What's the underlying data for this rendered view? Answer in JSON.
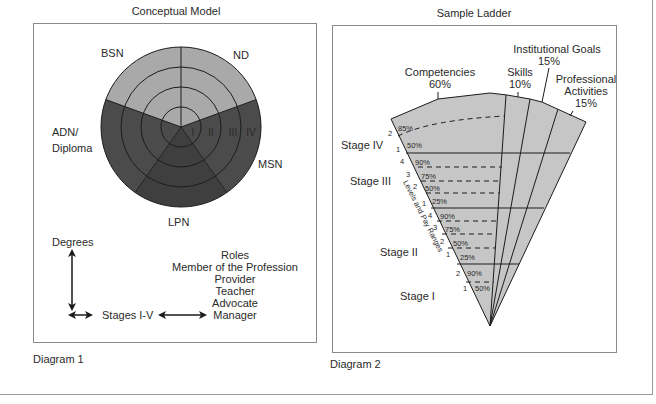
{
  "diagram1": {
    "title": "Conceptual Model",
    "caption": "Diagram 1",
    "segments": [
      {
        "label": "BSN",
        "color": "#a9a9a9"
      },
      {
        "label": "ND",
        "color": "#a9a9a9"
      },
      {
        "label": "MSN",
        "color": "#4b4b4b"
      },
      {
        "label": "LPN",
        "color": "#3f3f3f"
      },
      {
        "label_line1": "ADN/",
        "label_line2": "Diploma",
        "color": "#4b4b4b"
      }
    ],
    "rings": [
      "I",
      "II",
      "III",
      "IV"
    ],
    "legend": {
      "vertical_axis": "Degrees",
      "horizontal_axis": "Stages I-V",
      "roles_title": "Roles",
      "roles": [
        "Member of the Profession",
        "Provider",
        "Teacher",
        "Advocate",
        "Manager"
      ]
    }
  },
  "diagram2": {
    "title": "Sample Ladder",
    "caption": "Diagram 2",
    "fill_color": "#c6c6c6",
    "categories": [
      {
        "name": "Competencies",
        "pct": "60%"
      },
      {
        "name": "Skills",
        "pct": "10%"
      },
      {
        "name": "Institutional Goals",
        "pct": "15%"
      },
      {
        "name_line1": "Professional",
        "name_line2": "Activities",
        "pct": "15%"
      }
    ],
    "axis_label": "Levels and Pay Ranges",
    "stages": [
      {
        "name": "Stage IV",
        "levels": [
          {
            "level": "2",
            "pct": "85%"
          },
          {
            "level": "1",
            "pct": "50%"
          }
        ]
      },
      {
        "name": "Stage III",
        "levels": [
          {
            "level": "4",
            "pct": "90%"
          },
          {
            "level": "3",
            "pct": "75%"
          },
          {
            "level": "2",
            "pct": "50%"
          },
          {
            "level": "1",
            "pct": "25%"
          }
        ]
      },
      {
        "name": "Stage II",
        "levels": [
          {
            "level": "4",
            "pct": "90%"
          },
          {
            "level": "3",
            "pct": "75%"
          },
          {
            "level": "2",
            "pct": "50%"
          },
          {
            "level": "1",
            "pct": "25%"
          }
        ]
      },
      {
        "name": "Stage I",
        "levels": [
          {
            "level": "2",
            "pct": "90%"
          },
          {
            "level": "1",
            "pct": "50%"
          }
        ]
      }
    ]
  }
}
